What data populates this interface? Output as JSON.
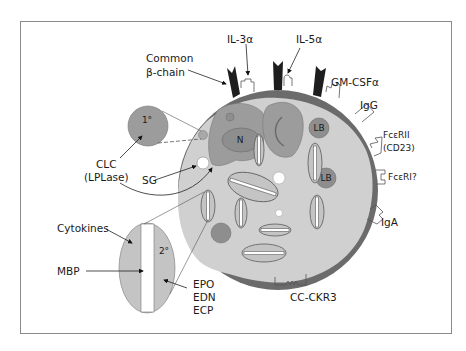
{
  "figure": {
    "colors": {
      "frame": "#8a8a8a",
      "membrane": "#6b6b6b",
      "cytoplasm": "#d0d0d0",
      "nucleus": "#9c9c9c",
      "lipid_body": "#8e8e8e",
      "granule": "#c4c4c4",
      "receptor_chain": "#1e1e1e"
    }
  },
  "labels": {
    "common_beta_chain_line1": "Common",
    "common_beta_chain_line2": "β-chain",
    "il3a": "IL-3α",
    "il5a": "IL-5α",
    "gmcsfa": "GM-CSFα",
    "igg": "IgG",
    "fceRII_line1": "FcεRII",
    "fceRII_line2": "(CD23)",
    "fceRI": "FcεRI?",
    "iga": "IgA",
    "cc_ckr3": "CC-CKR3",
    "clc_line1": "CLC",
    "clc_line2": "(LPLase)",
    "sg": "SG",
    "cytokines": "Cytokines",
    "mbp": "MBP",
    "epo": "EPO",
    "edn": "EDN",
    "ecp": "ECP"
  },
  "inner_labels": {
    "nucleus": "N",
    "lipid_body_1": "LB",
    "lipid_body_2": "LB",
    "primary_granule": "1°",
    "secondary_granule": "2°"
  }
}
